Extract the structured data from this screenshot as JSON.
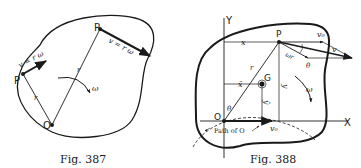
{
  "figures": [
    {
      "caption": "Fig. 387",
      "labels": {
        "point_p_top": "P",
        "point_p_left": "P",
        "origin": "O",
        "velocity_top": "v = r ω",
        "velocity_left": "v = r ω",
        "radius_short": "r",
        "radius_long": "r",
        "omega": "ω"
      }
    },
    {
      "caption": "Fig. 388",
      "labels": {
        "y_axis": "Y",
        "x_axis": "X",
        "point_p": "P",
        "origin": "O",
        "center_g": "G",
        "x_coord": "x",
        "x_bar": "x̄",
        "y_coord": "y",
        "y_bar": "ȳ",
        "radius": "r",
        "theta_origin": "θ",
        "theta_p": "θ",
        "omega": "ω",
        "omega_r": "ωr",
        "v0_top": "v₀",
        "v0_bottom": "v₀",
        "v": "v",
        "path_label": "Path of O"
      }
    }
  ],
  "colors": {
    "ink": "#1a1a1a",
    "background": "#ffffff"
  }
}
